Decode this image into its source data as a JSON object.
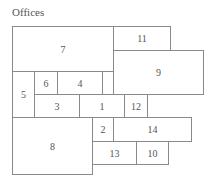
{
  "title": "Offices",
  "rooms": [
    {
      "id": "7",
      "label": "7"
    },
    {
      "id": "11",
      "label": "11"
    },
    {
      "id": "9",
      "label": "9"
    },
    {
      "id": "5",
      "label": "5"
    },
    {
      "id": "6",
      "label": "6"
    },
    {
      "id": "4",
      "label": "4"
    },
    {
      "id": "blank",
      "label": ""
    },
    {
      "id": "3",
      "label": "3"
    },
    {
      "id": "1",
      "label": "1"
    },
    {
      "id": "12",
      "label": "12"
    },
    {
      "id": "8",
      "label": "8"
    },
    {
      "id": "2",
      "label": "2"
    },
    {
      "id": "14",
      "label": "14"
    },
    {
      "id": "13",
      "label": "13"
    },
    {
      "id": "10",
      "label": "10"
    }
  ]
}
